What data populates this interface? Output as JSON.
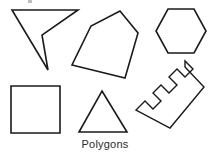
{
  "figure": {
    "caption": "Polygons",
    "caption_x": 105,
    "caption_y": 148,
    "background_color": "#ffffff",
    "stroke_color": "#1a1a1a",
    "fill_color": "#ffffff",
    "width": 212,
    "height": 155,
    "shape_count": 6,
    "shapes": [
      {
        "id": "arrow-dart",
        "name": "concave-quadrilateral-dart",
        "label": "Dart (concave quadrilateral)",
        "sides": 4,
        "convex": false,
        "points": "12,10 78,10 42,35 48,70"
      },
      {
        "id": "irregular-pentagon",
        "name": "irregular-pentagon",
        "label": "Irregular pentagon",
        "sides": 5,
        "convex": true,
        "points": "120,11 138,33 125,78 72,65 91,26"
      },
      {
        "id": "hexagon",
        "name": "regular-hexagon",
        "label": "Hexagon",
        "sides": 6,
        "convex": true,
        "points": "168,9 194,9 206,31 194,53 168,53 156,31"
      },
      {
        "id": "square",
        "name": "square",
        "label": "Square",
        "sides": 4,
        "convex": true,
        "points": "11,86 60,86 60,133 11,133"
      },
      {
        "id": "triangle",
        "name": "isosceles-triangle",
        "label": "Triangle",
        "sides": 3,
        "convex": true,
        "points": "102,91 127,132 79,132"
      },
      {
        "id": "comb-ruler",
        "name": "rotated-comb-polygon",
        "label": "Comb / ruler (rotated concave polygon)",
        "sides": 20,
        "convex": false,
        "notches": 4,
        "points": "185,67 204,87 170,128 136,110 145,101 153,109 161,101 153,93 161,85 169,93 177,85 169,77 177,69 185,77 193,69 185,61"
      }
    ]
  },
  "artifacts": {
    "top_mark_label": "page-edge-mark",
    "top_mark_x": 28,
    "top_mark_y": 0,
    "top_mark_w": 4,
    "top_mark_h": 4
  }
}
